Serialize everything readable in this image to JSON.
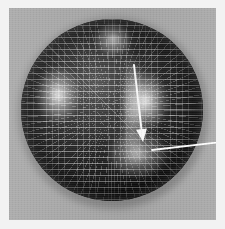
{
  "figure": {
    "title": "",
    "caption": "",
    "background_color": "#a9a9a9",
    "outer_margin_color": "#f2f2f2"
  },
  "panel": {
    "x": 9,
    "y": 8,
    "width": 207,
    "height": 212
  },
  "sphere": {
    "center_x": 112,
    "center_y": 110,
    "radius": 91,
    "surface_color": "#232323",
    "mesh_color": "#ececec",
    "mesh_parallel_spacing_px": 6,
    "mesh_meridian_spacing_px": 6,
    "shading": "diffuse-plus-specular"
  },
  "highlights": [
    {
      "name": "left-specular",
      "x": 58,
      "y": 95,
      "intensity": 0.92
    },
    {
      "name": "right-specular",
      "x": 145,
      "y": 101,
      "intensity": 0.95
    },
    {
      "name": "top-specular",
      "x": 113,
      "y": 39,
      "intensity": 0.8
    },
    {
      "name": "bottom-specular",
      "x": 138,
      "y": 154,
      "intensity": 0.7
    }
  ],
  "annotation": {
    "arrow": {
      "name": "pointer-arrow",
      "color": "#ffffff",
      "start_x": 134,
      "start_y": 65,
      "end_x": 143,
      "end_y": 142,
      "head_width": 11,
      "head_length": 13,
      "shaft_width": 2,
      "barb_x": 152,
      "barb_y": 150,
      "label": ""
    }
  },
  "chart_data": {
    "type": "scatter",
    "title": "",
    "xlabel": "",
    "ylabel": "",
    "categories": [],
    "values": []
  }
}
